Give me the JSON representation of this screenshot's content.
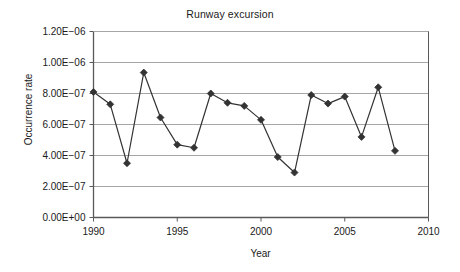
{
  "chart_data": {
    "type": "line",
    "title": "Runway excursion",
    "xlabel": "Year",
    "ylabel": "Occurrence rate",
    "x": [
      1990,
      1991,
      1992,
      1993,
      1994,
      1995,
      1996,
      1997,
      1998,
      1999,
      2000,
      2001,
      2002,
      2003,
      2004,
      2005,
      2006,
      2007,
      2008
    ],
    "values": [
      8.1e-07,
      7.3e-07,
      3.5e-07,
      9.35e-07,
      6.45e-07,
      4.7e-07,
      4.5e-07,
      8e-07,
      7.4e-07,
      7.2e-07,
      6.3e-07,
      3.9e-07,
      2.9e-07,
      7.9e-07,
      7.35e-07,
      7.8e-07,
      5.2e-07,
      8.4e-07,
      4.3e-07
    ],
    "series": [
      {
        "name": "Runway excursion",
        "values": [
          8.1e-07,
          7.3e-07,
          3.5e-07,
          9.35e-07,
          6.45e-07,
          4.7e-07,
          4.5e-07,
          8e-07,
          7.4e-07,
          7.2e-07,
          6.3e-07,
          3.9e-07,
          2.9e-07,
          7.9e-07,
          7.35e-07,
          7.8e-07,
          5.2e-07,
          8.4e-07,
          4.3e-07
        ]
      }
    ],
    "xlim": [
      1990,
      2010
    ],
    "ylim": [
      0,
      1.2e-06
    ],
    "xticks": [
      1990,
      1995,
      2000,
      2005,
      2010
    ],
    "xtick_labels": [
      "1990",
      "1995",
      "2000",
      "2005",
      "2010"
    ],
    "yticks": [
      0,
      2e-07,
      4e-07,
      6e-07,
      8e-07,
      1e-06,
      1.2e-06
    ],
    "ytick_labels": [
      "0.00E+00",
      "2.00E−07",
      "4.00E−07",
      "6.00E−07",
      "8.00E−07",
      "1.00E−06",
      "1.20E−06"
    ],
    "grid": "horizontal",
    "legend": "none",
    "marker": "diamond",
    "line_color": "#333333",
    "marker_color": "#333333",
    "grid_color": "#a6a6a6",
    "axis_color": "#595959",
    "background": "#ffffff"
  }
}
